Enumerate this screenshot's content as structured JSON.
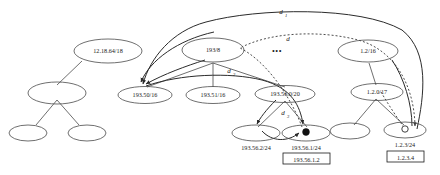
{
  "figure": {
    "type": "network-prefix-tree-diagram",
    "background": "#ffffff",
    "stroke_color": "#4a4a4a",
    "text_color": "#1a1a1a"
  },
  "nodes": {
    "left_subtree": {
      "root": {
        "label": "12.18.64/18"
      },
      "child": {
        "label": ""
      },
      "grandchildren": [
        {
          "label": ""
        },
        {
          "label": ""
        }
      ]
    },
    "center_subtree": {
      "root": {
        "label": "193/8"
      },
      "children": [
        {
          "label": "193.50/16"
        },
        {
          "label": "193.51/16"
        },
        {
          "label": "193.56.0/20"
        }
      ],
      "leaves": [
        {
          "label": "193.56.2/24"
        },
        {
          "label": "193.56.1/24"
        }
      ]
    },
    "right_subtree": {
      "root": {
        "label": "1.2/16"
      },
      "child": {
        "label": "1.2.0/17"
      },
      "leaves": [
        {
          "label": ""
        },
        {
          "label": "1.2.3/24"
        }
      ]
    }
  },
  "host_markers": [
    {
      "name": "filled-host-dot",
      "parent": "193.56.1/24",
      "style": "filled"
    },
    {
      "name": "hollow-host-dot",
      "parent": "1.2.3/24",
      "style": "hollow"
    }
  ],
  "boxed_addresses": [
    {
      "value": "193.56.1.2",
      "under": "193.56.1/24"
    },
    {
      "value": "1.2.3.4",
      "under": "1.2.3/24"
    }
  ],
  "arc_labels": {
    "d1": "d",
    "d1_sub": "1",
    "d_plain": "d",
    "d2": "d",
    "d2_sub": "2",
    "d3": "d",
    "d3_sub": "3"
  },
  "ellipsis": {
    "dots": "•••"
  }
}
